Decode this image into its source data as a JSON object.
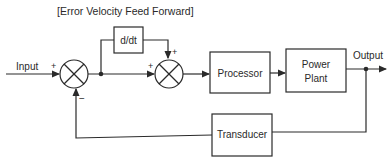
{
  "diagram": {
    "title": "[Error Velocity Feed Forward]",
    "input_label": "Input",
    "output_label": "Output",
    "blocks": {
      "derivative": "d/dt",
      "processor": "Processor",
      "power_plant_line1": "Power",
      "power_plant_line2": "Plant",
      "transducer": "Transducer"
    },
    "summing_junction_1": {
      "sign_input": "+",
      "sign_feedback": "−"
    },
    "summing_junction_2": {
      "sign_left": "+",
      "sign_top": "+"
    },
    "colors": {
      "line": "#2a2a2a",
      "background": "#ffffff"
    }
  }
}
